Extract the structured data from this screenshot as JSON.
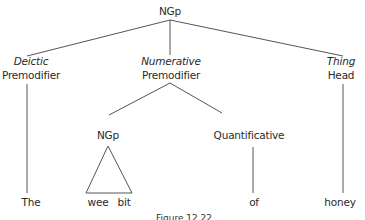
{
  "diagram": {
    "type": "syntax-tree",
    "root": {
      "label": "NGp"
    },
    "level1": [
      {
        "function": "Deictic",
        "role": "Premodifier",
        "leaf": "The"
      },
      {
        "function": "Numerative",
        "role": "Premodifier"
      },
      {
        "function": "Thing",
        "role": "Head",
        "leaf": "honey"
      }
    ],
    "level2": [
      {
        "label": "NGp",
        "collapsed_as_triangle": true,
        "leaves": [
          "wee",
          "bit"
        ]
      },
      {
        "label": "Quantificative",
        "leaf": "of"
      }
    ],
    "caption": "Figure 12.22",
    "colors": {
      "line": "#555555",
      "text": "#2a2a2a",
      "background": "#ffffff"
    }
  }
}
